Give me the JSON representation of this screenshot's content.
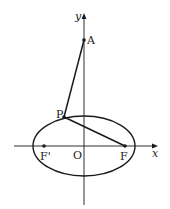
{
  "diagram": {
    "colors": {
      "line": "#1a1a1a",
      "background": "#ffffff"
    },
    "axes": {
      "x_label": "x",
      "y_label": "y",
      "origin_label": "O"
    },
    "points": {
      "A": {
        "label": "A",
        "px": [
          84,
          40
        ]
      },
      "P": {
        "label": "P",
        "px": [
          64,
          117
        ]
      },
      "F": {
        "label": "F",
        "px": [
          125,
          146
        ]
      },
      "F_prime": {
        "label": "F'",
        "px": [
          44,
          146
        ]
      }
    },
    "ellipse": {
      "center_px": [
        84,
        146
      ],
      "rx": 51,
      "ry": 30
    },
    "segments": [
      {
        "from": "A",
        "to": "P"
      },
      {
        "from": "P",
        "to": "F"
      }
    ]
  }
}
